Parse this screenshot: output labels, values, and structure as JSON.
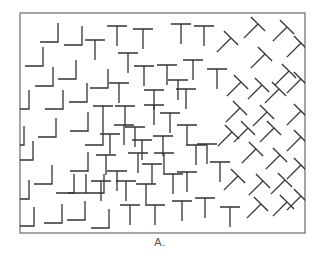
{
  "figure": {
    "caption": "A.",
    "frame": {
      "x": 20,
      "y": 13,
      "width": 285,
      "height": 220,
      "stroke": "#6a6a6a"
    },
    "stroke_color": "#333333",
    "regions": [
      {
        "name": "L-region",
        "shape": "L",
        "description": "upright L-shaped elements, left third"
      },
      {
        "name": "T-region",
        "shape": "T",
        "description": "upright T-shaped elements, middle third"
      },
      {
        "name": "tilted-T-region",
        "shape": "T45",
        "description": "T-shaped elements rotated 45 degrees, right third"
      }
    ],
    "elements": [
      {
        "type": "L",
        "x": 58,
        "y": 42
      },
      {
        "type": "L",
        "x": 82,
        "y": 45
      },
      {
        "type": "L",
        "x": 43,
        "y": 66
      },
      {
        "type": "L",
        "x": 53,
        "y": 86
      },
      {
        "type": "L",
        "x": 76,
        "y": 79
      },
      {
        "type": "L",
        "x": 29,
        "y": 109
      },
      {
        "type": "L",
        "x": 63,
        "y": 109
      },
      {
        "type": "L",
        "x": 87,
        "y": 102
      },
      {
        "type": "L",
        "x": 108,
        "y": 88
      },
      {
        "type": "L",
        "x": 56,
        "y": 137
      },
      {
        "type": "L",
        "x": 88,
        "y": 131
      },
      {
        "type": "L",
        "x": 33,
        "y": 160
      },
      {
        "type": "L",
        "x": 52,
        "y": 184
      },
      {
        "type": "L",
        "x": 88,
        "y": 171
      },
      {
        "type": "L",
        "x": 74,
        "y": 193
      },
      {
        "type": "L",
        "x": 29,
        "y": 199
      },
      {
        "type": "L",
        "x": 86,
        "y": 193
      },
      {
        "type": "L",
        "x": 104,
        "y": 193
      },
      {
        "type": "L",
        "x": 34,
        "y": 226
      },
      {
        "type": "L",
        "x": 62,
        "y": 223
      },
      {
        "type": "L",
        "x": 85,
        "y": 220
      },
      {
        "type": "L",
        "x": 109,
        "y": 228
      },
      {
        "type": "L",
        "x": 103,
        "y": 145
      },
      {
        "type": "L",
        "x": 24,
        "y": 145
      },
      {
        "type": "T",
        "x": 95,
        "y": 40
      },
      {
        "type": "T",
        "x": 117,
        "y": 26
      },
      {
        "type": "T",
        "x": 143,
        "y": 29
      },
      {
        "type": "T",
        "x": 181,
        "y": 24
      },
      {
        "type": "T",
        "x": 204,
        "y": 26
      },
      {
        "type": "T",
        "x": 128,
        "y": 53
      },
      {
        "type": "T",
        "x": 144,
        "y": 66
      },
      {
        "type": "T",
        "x": 167,
        "y": 65
      },
      {
        "type": "T",
        "x": 193,
        "y": 60
      },
      {
        "type": "T",
        "x": 119,
        "y": 83
      },
      {
        "type": "T",
        "x": 154,
        "y": 90
      },
      {
        "type": "T",
        "x": 178,
        "y": 80
      },
      {
        "type": "T",
        "x": 217,
        "y": 69
      },
      {
        "type": "T",
        "x": 103,
        "y": 106
      },
      {
        "type": "T",
        "x": 125,
        "y": 106
      },
      {
        "type": "T",
        "x": 154,
        "y": 105
      },
      {
        "type": "T",
        "x": 186,
        "y": 89
      },
      {
        "type": "T",
        "x": 124,
        "y": 125
      },
      {
        "type": "T",
        "x": 170,
        "y": 113
      },
      {
        "type": "T",
        "x": 135,
        "y": 127
      },
      {
        "type": "T",
        "x": 163,
        "y": 136
      },
      {
        "type": "T",
        "x": 187,
        "y": 125
      },
      {
        "type": "T",
        "x": 110,
        "y": 134
      },
      {
        "type": "T",
        "x": 142,
        "y": 140
      },
      {
        "type": "T",
        "x": 106,
        "y": 155
      },
      {
        "type": "T",
        "x": 138,
        "y": 153
      },
      {
        "type": "T",
        "x": 164,
        "y": 153
      },
      {
        "type": "T",
        "x": 196,
        "y": 145
      },
      {
        "type": "T",
        "x": 117,
        "y": 171
      },
      {
        "type": "T",
        "x": 152,
        "y": 164
      },
      {
        "type": "T",
        "x": 187,
        "y": 172
      },
      {
        "type": "T",
        "x": 207,
        "y": 144
      },
      {
        "type": "T",
        "x": 126,
        "y": 181
      },
      {
        "type": "T",
        "x": 173,
        "y": 174
      },
      {
        "type": "T",
        "x": 101,
        "y": 181
      },
      {
        "type": "T",
        "x": 220,
        "y": 162
      },
      {
        "type": "T",
        "x": 130,
        "y": 205
      },
      {
        "type": "T",
        "x": 155,
        "y": 205
      },
      {
        "type": "T",
        "x": 182,
        "y": 201
      },
      {
        "type": "T",
        "x": 205,
        "y": 198
      },
      {
        "type": "T",
        "x": 230,
        "y": 207
      },
      {
        "type": "T",
        "x": 146,
        "y": 184
      },
      {
        "type": "T45",
        "x": 231,
        "y": 38
      },
      {
        "type": "T45",
        "x": 258,
        "y": 24
      },
      {
        "type": "T45",
        "x": 287,
        "y": 27
      },
      {
        "type": "T45",
        "x": 301,
        "y": 43
      },
      {
        "type": "T45",
        "x": 265,
        "y": 54
      },
      {
        "type": "T45",
        "x": 289,
        "y": 71
      },
      {
        "type": "T45",
        "x": 301,
        "y": 79
      },
      {
        "type": "T45",
        "x": 241,
        "y": 82
      },
      {
        "type": "T45",
        "x": 262,
        "y": 85
      },
      {
        "type": "T45",
        "x": 279,
        "y": 89
      },
      {
        "type": "T45",
        "x": 240,
        "y": 108
      },
      {
        "type": "T45",
        "x": 267,
        "y": 112
      },
      {
        "type": "T45",
        "x": 301,
        "y": 111
      },
      {
        "type": "T45",
        "x": 248,
        "y": 128
      },
      {
        "type": "T45",
        "x": 274,
        "y": 128
      },
      {
        "type": "T45",
        "x": 301,
        "y": 137
      },
      {
        "type": "T45",
        "x": 232,
        "y": 132
      },
      {
        "type": "T45",
        "x": 256,
        "y": 149
      },
      {
        "type": "T45",
        "x": 280,
        "y": 155
      },
      {
        "type": "T45",
        "x": 301,
        "y": 165
      },
      {
        "type": "T45",
        "x": 238,
        "y": 176
      },
      {
        "type": "T45",
        "x": 263,
        "y": 181
      },
      {
        "type": "T45",
        "x": 285,
        "y": 180
      },
      {
        "type": "T45",
        "x": 261,
        "y": 204
      },
      {
        "type": "T45",
        "x": 287,
        "y": 202
      },
      {
        "type": "T45",
        "x": 301,
        "y": 196
      }
    ]
  }
}
